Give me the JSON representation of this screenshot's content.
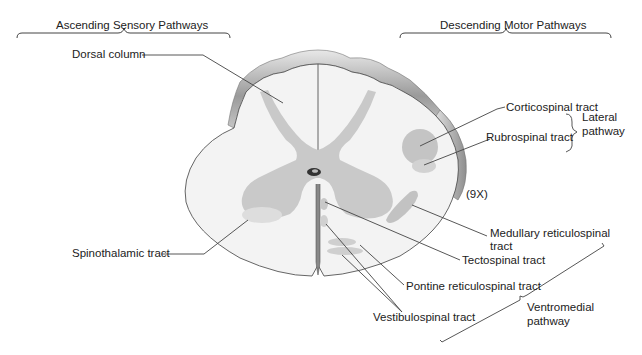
{
  "headers": {
    "ascending": "Ascending Sensory Pathways",
    "descending": "Descending Motor Pathways"
  },
  "labels": {
    "dorsal_column": "Dorsal column",
    "spinothalamic_tract": "Spinothalamic tract",
    "corticospinal_tract": "Corticospinal tract",
    "rubrospinal_tract": "Rubrospinal tract",
    "medullary_reticulospinal_line1": "Medullary reticulospinal",
    "medullary_reticulospinal_line2": "tract",
    "tectospinal_tract": "Tectospinal tract",
    "pontine_reticulospinal_tract": "Pontine reticulospinal tract",
    "vestibulospinal_tract": "Vestibulospinal tract",
    "magnification": "(9X)"
  },
  "groups": {
    "lateral_line1": "Lateral",
    "lateral_line2": "pathway",
    "ventromedial_line1": "Ventromedial",
    "ventromedial_line2": "pathway"
  },
  "colors": {
    "white_matter": "#f2f2f2",
    "gray_matter": "#c8c8c8",
    "tract_fill": "#bdbdbd",
    "light_tract": "#dcdcdc",
    "outline": "#555555",
    "rim": "#a8a8a8"
  }
}
